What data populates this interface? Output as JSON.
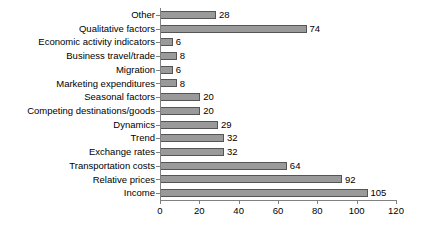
{
  "chart_data": {
    "type": "bar",
    "orientation": "horizontal",
    "title": "",
    "subtitle": "",
    "xlabel": "",
    "ylabel": "",
    "xlim": [
      0,
      120
    ],
    "xticks": [
      0,
      20,
      40,
      60,
      80,
      100,
      120
    ],
    "grid": false,
    "legend": false,
    "show_value_labels": true,
    "categories": [
      "Other",
      "Qualitative factors",
      "Economic activity indicators",
      "Business travel/trade",
      "Migration",
      "Marketing expenditures",
      "Seasonal factors",
      "Competing destinations/goods",
      "Dynamics",
      "Trend",
      "Exchange rates",
      "Transportation costs",
      "Relative prices",
      "Income"
    ],
    "values": [
      28,
      74,
      6,
      8,
      6,
      8,
      20,
      20,
      29,
      32,
      32,
      64,
      92,
      105
    ],
    "series": [
      {
        "name": "",
        "values": [
          28,
          74,
          6,
          8,
          6,
          8,
          20,
          20,
          29,
          32,
          32,
          64,
          92,
          105
        ]
      }
    ],
    "colors": {
      "bar_fill": "#9a9a9a",
      "bar_edge": "#555555",
      "axis": "#808080",
      "text": "#000000",
      "background": "#ffffff"
    }
  }
}
